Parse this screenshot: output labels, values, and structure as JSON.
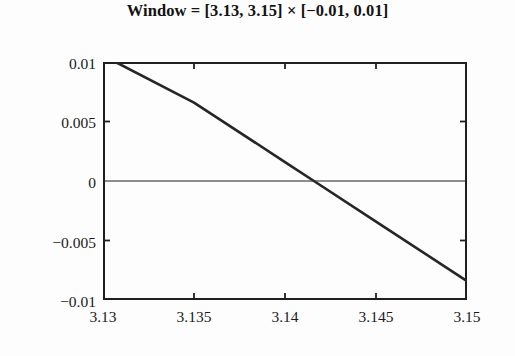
{
  "chart_data": {
    "type": "line",
    "title": "Window = [3.13, 3.15] × [−0.01, 0.01]",
    "xlabel": "",
    "ylabel": "",
    "xlim": [
      3.13,
      3.15
    ],
    "ylim": [
      -0.01,
      0.01
    ],
    "grid": false,
    "legend": null,
    "xticks": [
      {
        "value": 3.13,
        "label": "3.13"
      },
      {
        "value": 3.135,
        "label": "3.135"
      },
      {
        "value": 3.14,
        "label": "3.14"
      },
      {
        "value": 3.145,
        "label": "3.145"
      },
      {
        "value": 3.15,
        "label": "3.15"
      }
    ],
    "yticks": [
      {
        "value": 0.01,
        "label": "0.01"
      },
      {
        "value": 0.005,
        "label": "0.005"
      },
      {
        "value": 0.0,
        "label": "0"
      },
      {
        "value": -0.005,
        "label": "−0.005"
      },
      {
        "value": -0.01,
        "label": "−0.01"
      }
    ],
    "series": [
      {
        "name": "curve",
        "color": "#262626",
        "linewidth": 2.6,
        "points": [
          {
            "x": 3.13069,
            "y": 0.01
          },
          {
            "x": 3.135,
            "y": 0.00659
          },
          {
            "x": 3.14,
            "y": 0.00159
          },
          {
            "x": 3.14159,
            "y": 0.0
          },
          {
            "x": 3.145,
            "y": -0.00341
          },
          {
            "x": 3.15,
            "y": -0.00841
          }
        ]
      },
      {
        "name": "zero-reference-line",
        "color": "#1f1f1f",
        "linewidth": 1.2,
        "points": [
          {
            "x": 3.13,
            "y": 0.0
          },
          {
            "x": 3.15,
            "y": 0.0
          }
        ]
      }
    ],
    "zero_crossing": {
      "x": 3.14159,
      "y": 0.0
    },
    "axes": {
      "frame": true,
      "tick_direction": "in",
      "frame_color": "#1f1f1f"
    }
  }
}
